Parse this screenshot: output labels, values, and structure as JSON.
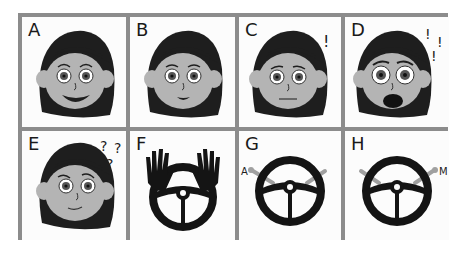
{
  "panels": [
    {
      "label": "A",
      "type": "face",
      "expression": "big-smile",
      "symbols": ""
    },
    {
      "label": "B",
      "type": "face",
      "expression": "small-smile",
      "symbols": ""
    },
    {
      "label": "C",
      "type": "face",
      "expression": "neutral-worried",
      "symbols": "!"
    },
    {
      "label": "D",
      "type": "face",
      "expression": "shocked-open-mouth",
      "symbols": "!!!"
    },
    {
      "label": "E",
      "type": "face",
      "expression": "confused",
      "symbols": "???"
    },
    {
      "label": "F",
      "type": "steering-wheel",
      "variant": "hands-raised",
      "side_label": ""
    },
    {
      "label": "G",
      "type": "steering-wheel",
      "variant": "left-lever-A",
      "side_label": "A"
    },
    {
      "label": "H",
      "type": "steering-wheel",
      "variant": "right-lever-M",
      "side_label": "M"
    }
  ],
  "colors": {
    "grid_border": "#8c8c8c",
    "panel_bg": "#fcfcfc",
    "hair": "#1e1e1e",
    "skin": "#b4b4b4",
    "wheel": "#141414",
    "lever": "#a0a0a0"
  }
}
